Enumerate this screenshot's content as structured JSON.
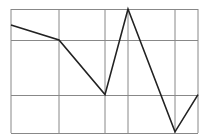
{
  "chart_data": {
    "type": "line",
    "title": "",
    "xlabel": "",
    "ylabel": "",
    "x": [
      0,
      1,
      2,
      3,
      4,
      5
    ],
    "x_positions_px": [
      11,
      59,
      105,
      128,
      175,
      198
    ],
    "series": [
      {
        "name": "series-1",
        "values": [
          87,
          75,
          31,
          100,
          1,
          31
        ]
      }
    ],
    "ylim": [
      0,
      100
    ],
    "grid": true,
    "gridlines_y_values": [
      100,
      75,
      31,
      0
    ],
    "legend": null,
    "tick_labels_visible": false
  },
  "style": {
    "line_color": "#222222",
    "grid_color": "#888888",
    "background": "#ffffff"
  },
  "frame": {
    "left": 11,
    "right": 198,
    "top": 9,
    "bottom": 133
  }
}
